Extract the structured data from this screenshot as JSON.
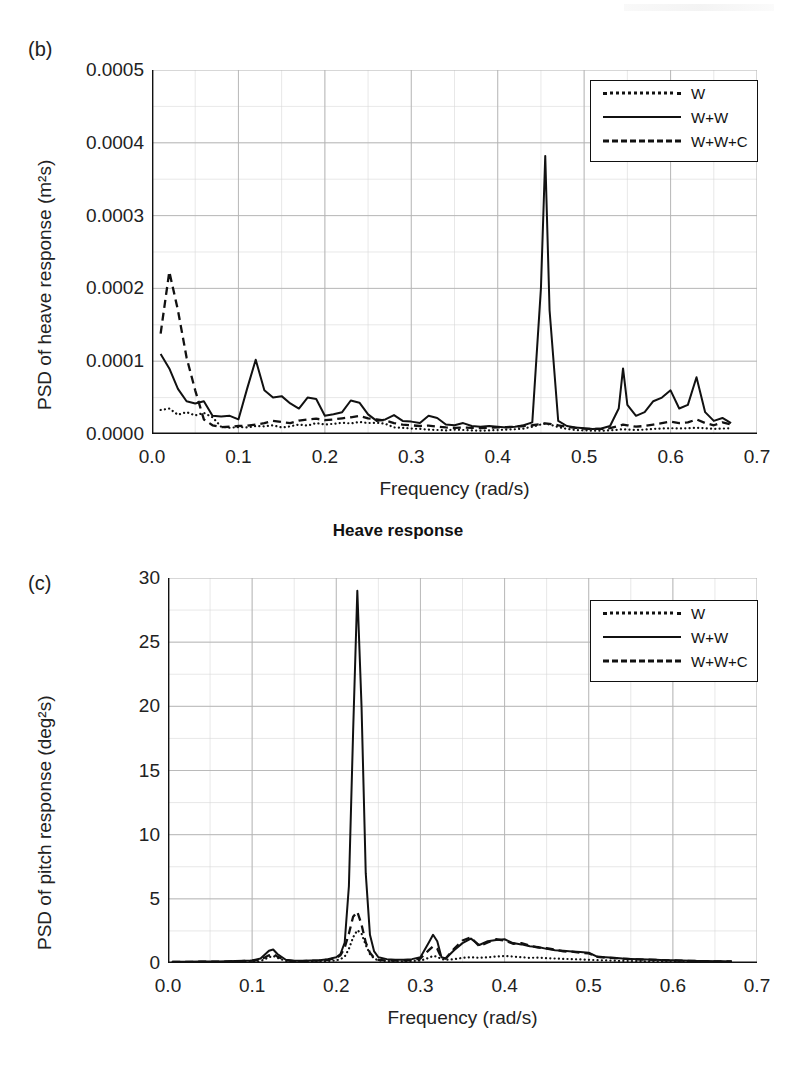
{
  "figure": {
    "caption_between": "Heave response",
    "panels": [
      "b",
      "c"
    ]
  },
  "panel_b": {
    "label": "(b)",
    "ylabel": "PSD of heave response (m²s)",
    "xlabel": "Frequency (rad/s)",
    "yticks": [
      "0.0000",
      "0.0001",
      "0.0002",
      "0.0003",
      "0.0004",
      "0.0005"
    ],
    "xticks": [
      "0.0",
      "0.1",
      "0.2",
      "0.3",
      "0.4",
      "0.5",
      "0.6",
      "0.7"
    ],
    "legend": [
      {
        "name": "legend-w",
        "label": "W",
        "style": "dotted"
      },
      {
        "name": "legend-ww",
        "label": "W+W",
        "style": "solid"
      },
      {
        "name": "legend-wwc",
        "label": "W+W+C",
        "style": "dashed"
      }
    ]
  },
  "panel_c": {
    "label": "(c)",
    "ylabel": "PSD of pitch response (deg²s)",
    "xlabel": "Frequency (rad/s)",
    "yticks": [
      "0",
      "5",
      "10",
      "15",
      "20",
      "25",
      "30"
    ],
    "xticks": [
      "0.0",
      "0.1",
      "0.2",
      "0.3",
      "0.4",
      "0.5",
      "0.6",
      "0.7"
    ],
    "legend": [
      {
        "name": "legend-w",
        "label": "W",
        "style": "dotted"
      },
      {
        "name": "legend-ww",
        "label": "W+W",
        "style": "solid"
      },
      {
        "name": "legend-wwc",
        "label": "W+W+C",
        "style": "dashed"
      }
    ]
  },
  "chart_data": [
    {
      "id": "panel_b",
      "type": "line",
      "title": "Heave response",
      "panel_label": "(b)",
      "xlabel": "Frequency (rad/s)",
      "ylabel": "PSD of heave response (m²s)",
      "xlim": [
        0.0,
        0.7
      ],
      "ylim": [
        0.0,
        0.0005
      ],
      "xticks": [
        0.0,
        0.1,
        0.2,
        0.3,
        0.4,
        0.5,
        0.6,
        0.7
      ],
      "yticks": [
        0.0,
        0.0001,
        0.0002,
        0.0003,
        0.0004,
        0.0005
      ],
      "grid": true,
      "legend_position": "top-right",
      "x": [
        0.01,
        0.02,
        0.03,
        0.04,
        0.05,
        0.06,
        0.07,
        0.08,
        0.09,
        0.1,
        0.11,
        0.12,
        0.13,
        0.14,
        0.15,
        0.16,
        0.17,
        0.18,
        0.19,
        0.2,
        0.21,
        0.22,
        0.23,
        0.24,
        0.25,
        0.26,
        0.27,
        0.28,
        0.29,
        0.3,
        0.31,
        0.32,
        0.33,
        0.34,
        0.35,
        0.36,
        0.37,
        0.38,
        0.39,
        0.4,
        0.41,
        0.42,
        0.43,
        0.44,
        0.45,
        0.455,
        0.46,
        0.47,
        0.48,
        0.49,
        0.5,
        0.51,
        0.52,
        0.53,
        0.54,
        0.545,
        0.55,
        0.56,
        0.57,
        0.58,
        0.59,
        0.6,
        0.61,
        0.62,
        0.63,
        0.64,
        0.65,
        0.66,
        0.67
      ],
      "series": [
        {
          "name": "W",
          "style": "dotted",
          "values": [
            3.3e-05,
            3.5e-05,
            2.65e-05,
            3e-05,
            2.55e-05,
            2.9e-05,
            2.3e-05,
            1e-05,
            8.5e-06,
            9.5e-06,
            9e-06,
            1.1e-05,
            1.05e-05,
            1.2e-05,
            9e-06,
            1.05e-05,
            1.3e-05,
            1.15e-05,
            1.5e-05,
            1.3e-05,
            1.4e-05,
            1.55e-05,
            1.45e-05,
            1.65e-05,
            1.5e-05,
            1.55e-05,
            1.4e-05,
            9e-06,
            8.5e-06,
            7.5e-06,
            7e-06,
            6e-06,
            5.5e-06,
            5e-06,
            6e-06,
            5.5e-06,
            5e-06,
            4.5e-06,
            5e-06,
            5.5e-06,
            6e-06,
            6.5e-06,
            7.5e-06,
            1e-05,
            1.3e-05,
            1.45e-05,
            1.3e-05,
            9.5e-06,
            7e-06,
            5.5e-06,
            5e-06,
            4.5e-06,
            4.5e-06,
            5e-06,
            6e-06,
            6.5e-06,
            6e-06,
            5.5e-06,
            6e-06,
            7e-06,
            7.5e-06,
            8e-06,
            7.5e-06,
            8e-06,
            8.5e-06,
            8e-06,
            7e-06,
            7.5e-06,
            8e-06
          ]
        },
        {
          "name": "W+W",
          "style": "solid",
          "values": [
            0.00011,
            9e-05,
            6.2e-05,
            4.5e-05,
            4.2e-05,
            4.5e-05,
            2.5e-05,
            2.4e-05,
            2.5e-05,
            2e-05,
            6.2e-05,
            0.000102,
            6e-05,
            5e-05,
            5.2e-05,
            4.2e-05,
            3.5e-05,
            5e-05,
            4.8e-05,
            2.5e-05,
            2.7e-05,
            3e-05,
            4.6e-05,
            4.3e-05,
            2.7e-05,
            1.8e-05,
            2e-05,
            2.6e-05,
            1.8e-05,
            1.7e-05,
            1.5e-05,
            2.5e-05,
            2.2e-05,
            1.3e-05,
            1.2e-05,
            1.5e-05,
            1.1e-05,
            1e-05,
            1.1e-05,
            1e-05,
            9e-06,
            1e-05,
            1.2e-05,
            1.6e-05,
            0.0002,
            0.000382,
            0.00017,
            1.8e-05,
            1.1e-05,
            9e-06,
            8e-06,
            7e-06,
            7.5e-06,
            1.1e-05,
            3.5e-05,
            9e-05,
            4e-05,
            2.5e-05,
            3e-05,
            4.5e-05,
            5e-05,
            6e-05,
            3.5e-05,
            4e-05,
            7.8e-05,
            3e-05,
            1.8e-05,
            2.2e-05,
            1.5e-05
          ]
        },
        {
          "name": "W+W+C",
          "style": "dashed",
          "values": [
            0.000138,
            0.000223,
            0.00017,
            0.000105,
            6e-05,
            2e-05,
            1.2e-05,
            9.5e-06,
            1e-05,
            1.1e-05,
            1.15e-05,
            1.3e-05,
            1.5e-05,
            1.8e-05,
            1.65e-05,
            1.5e-05,
            1.85e-05,
            2e-05,
            2.1e-05,
            1.9e-05,
            2e-05,
            2.15e-05,
            2.3e-05,
            2.5e-05,
            2.15e-05,
            2e-05,
            1.85e-05,
            1.5e-05,
            1.3e-05,
            1.2e-05,
            1.1e-05,
            1.15e-05,
            1e-05,
            9e-06,
            8.5e-06,
            9e-06,
            8.5e-06,
            8e-06,
            8.5e-06,
            9e-06,
            9.5e-06,
            1e-05,
            1.1e-05,
            1.2e-05,
            1.35e-05,
            1.45e-05,
            1.4e-05,
            1.2e-05,
            1e-05,
            8.5e-06,
            7.5e-06,
            7e-06,
            7e-06,
            8e-06,
            1.1e-05,
            1.3e-05,
            1.2e-05,
            1e-05,
            1.1e-05,
            1.3e-05,
            1.5e-05,
            1.7e-05,
            1.5e-05,
            1.6e-05,
            2e-05,
            1.5e-05,
            1.2e-05,
            1.6e-05,
            1.3e-05
          ]
        }
      ]
    },
    {
      "id": "panel_c",
      "type": "line",
      "panel_label": "(c)",
      "xlabel": "Frequency (rad/s)",
      "ylabel": "PSD of pitch response (deg²s)",
      "xlim": [
        0.0,
        0.7
      ],
      "ylim": [
        0,
        30
      ],
      "xticks": [
        0.0,
        0.1,
        0.2,
        0.3,
        0.4,
        0.5,
        0.6,
        0.7
      ],
      "yticks": [
        0,
        5,
        10,
        15,
        20,
        25,
        30
      ],
      "grid": true,
      "legend_position": "top-right",
      "x": [
        0.005,
        0.02,
        0.04,
        0.06,
        0.08,
        0.1,
        0.11,
        0.12,
        0.125,
        0.13,
        0.14,
        0.15,
        0.16,
        0.17,
        0.18,
        0.19,
        0.2,
        0.205,
        0.21,
        0.215,
        0.22,
        0.225,
        0.23,
        0.235,
        0.24,
        0.245,
        0.25,
        0.26,
        0.27,
        0.28,
        0.29,
        0.3,
        0.31,
        0.315,
        0.32,
        0.325,
        0.33,
        0.34,
        0.35,
        0.36,
        0.37,
        0.38,
        0.39,
        0.4,
        0.41,
        0.42,
        0.43,
        0.44,
        0.45,
        0.46,
        0.47,
        0.48,
        0.49,
        0.5,
        0.51,
        0.52,
        0.53,
        0.54,
        0.55,
        0.56,
        0.57,
        0.58,
        0.59,
        0.6,
        0.61,
        0.62,
        0.63,
        0.64,
        0.65,
        0.66,
        0.67
      ],
      "series": [
        {
          "name": "W",
          "style": "dotted",
          "values": [
            0.05,
            0.05,
            0.06,
            0.06,
            0.07,
            0.1,
            0.15,
            0.45,
            0.55,
            0.4,
            0.15,
            0.1,
            0.1,
            0.12,
            0.12,
            0.15,
            0.2,
            0.3,
            0.5,
            1.1,
            2.0,
            2.55,
            2.3,
            1.4,
            0.7,
            0.35,
            0.2,
            0.15,
            0.12,
            0.12,
            0.15,
            0.18,
            0.4,
            0.55,
            0.5,
            0.3,
            0.25,
            0.3,
            0.4,
            0.45,
            0.4,
            0.45,
            0.5,
            0.55,
            0.5,
            0.45,
            0.4,
            0.42,
            0.38,
            0.35,
            0.32,
            0.3,
            0.28,
            0.25,
            0.22,
            0.2,
            0.18,
            0.16,
            0.15,
            0.14,
            0.13,
            0.12,
            0.12,
            0.11,
            0.1,
            0.1,
            0.09,
            0.09,
            0.08,
            0.08,
            0.08
          ]
        },
        {
          "name": "W+W",
          "style": "solid",
          "values": [
            0.1,
            0.1,
            0.12,
            0.12,
            0.15,
            0.2,
            0.35,
            0.95,
            1.05,
            0.7,
            0.25,
            0.18,
            0.18,
            0.2,
            0.22,
            0.3,
            0.45,
            0.7,
            1.6,
            6.0,
            18.0,
            29.0,
            20.0,
            7.0,
            2.2,
            0.9,
            0.45,
            0.3,
            0.25,
            0.25,
            0.3,
            0.45,
            1.6,
            2.2,
            1.7,
            0.45,
            0.35,
            1.0,
            1.55,
            1.9,
            1.4,
            1.7,
            1.8,
            1.85,
            1.55,
            1.45,
            1.3,
            1.25,
            1.1,
            1.0,
            0.95,
            0.9,
            0.85,
            0.8,
            0.5,
            0.45,
            0.4,
            0.35,
            0.32,
            0.3,
            0.28,
            0.25,
            0.22,
            0.22,
            0.2,
            0.18,
            0.16,
            0.15,
            0.14,
            0.13,
            0.12
          ]
        },
        {
          "name": "W+W+C",
          "style": "dashed",
          "values": [
            0.08,
            0.08,
            0.1,
            0.1,
            0.12,
            0.18,
            0.25,
            0.6,
            0.7,
            0.5,
            0.2,
            0.15,
            0.15,
            0.18,
            0.2,
            0.25,
            0.4,
            0.6,
            1.2,
            2.3,
            3.6,
            4.0,
            3.0,
            1.6,
            0.8,
            0.4,
            0.25,
            0.2,
            0.18,
            0.18,
            0.22,
            0.35,
            1.0,
            1.3,
            1.1,
            0.4,
            0.35,
            1.1,
            1.75,
            2.0,
            1.3,
            1.6,
            1.85,
            1.75,
            1.5,
            1.55,
            1.35,
            1.2,
            1.15,
            1.05,
            0.9,
            0.88,
            0.8,
            0.75,
            0.48,
            0.42,
            0.38,
            0.34,
            0.3,
            0.28,
            0.26,
            0.24,
            0.22,
            0.2,
            0.18,
            0.17,
            0.15,
            0.14,
            0.13,
            0.12,
            0.12
          ]
        }
      ]
    }
  ]
}
